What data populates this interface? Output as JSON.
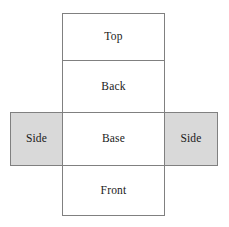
{
  "diagram": {
    "border_color": "#808080",
    "shaded_fill": "#d9d9d9",
    "unshaded_fill": "#ffffff",
    "text_color": "#1a1a1a",
    "panels": [
      {
        "id": "top",
        "label": "Top",
        "shaded": false
      },
      {
        "id": "back",
        "label": "Back",
        "shaded": false
      },
      {
        "id": "base",
        "label": "Base",
        "shaded": false
      },
      {
        "id": "front",
        "label": "Front",
        "shaded": false
      },
      {
        "id": "side-left",
        "label": "Side",
        "shaded": true
      },
      {
        "id": "side-right",
        "label": "Side",
        "shaded": true
      }
    ]
  }
}
